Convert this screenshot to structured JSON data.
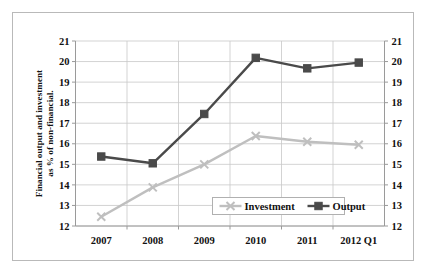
{
  "chart_data": {
    "type": "line",
    "title": "",
    "subtitle": "",
    "xlabel": "",
    "ylabel": "Financial output and investment as % of non-financial.",
    "ylabel_right": "",
    "categories": [
      "2007",
      "2008",
      "2009",
      "2010",
      "2011",
      "2012 Q1"
    ],
    "ylim": [
      12,
      21
    ],
    "ytick_step": 1,
    "yticks": [
      21,
      20,
      19,
      18,
      17,
      16,
      15,
      14,
      13,
      12
    ],
    "yticks_right": [
      21,
      20,
      19,
      18,
      17,
      16,
      15,
      14,
      13,
      12
    ],
    "grid": true,
    "grid_axis": "y",
    "legend_position": "inside-bottom-center",
    "series": [
      {
        "name": "Investment",
        "values": [
          12.45,
          13.88,
          15.0,
          16.38,
          16.1,
          15.95
        ],
        "color": "#bfbfbf",
        "marker": "x"
      },
      {
        "name": "Output",
        "values": [
          15.38,
          15.05,
          17.45,
          20.18,
          19.67,
          19.95
        ],
        "color": "#4a4a4a",
        "marker": "square"
      }
    ]
  },
  "legend": {
    "items": [
      {
        "label": "Investment"
      },
      {
        "label": "Output"
      }
    ]
  },
  "axes": {
    "left_title": "Financial output and investment as % of non-financial.",
    "left_ticks": [
      "21",
      "20",
      "19",
      "18",
      "17",
      "16",
      "15",
      "14",
      "13",
      "12"
    ],
    "right_ticks": [
      "21",
      "20",
      "19",
      "18",
      "17",
      "16",
      "15",
      "14",
      "13",
      "12"
    ],
    "x_ticks": [
      "2007",
      "2008",
      "2009",
      "2010",
      "2011",
      "2012 Q1"
    ]
  },
  "colors": {
    "investment": "#bfbfbf",
    "output": "#4a4a4a",
    "grid": "#c8c8c8",
    "axis": "#9a9a9a",
    "frame": "#b9b9b9",
    "text": "#111111",
    "background": "#ffffff"
  }
}
